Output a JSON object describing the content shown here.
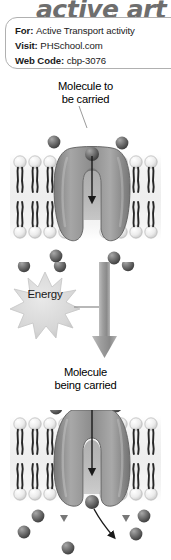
{
  "logo": {
    "text": "active art",
    "color": "#6e6e6e"
  },
  "info_card": {
    "rows": [
      {
        "label": "For:",
        "value": "Active Transport activity"
      },
      {
        "label": "Visit:",
        "value": "PHSchool.com"
      },
      {
        "label": "Web Code:",
        "value": "cbp-3076"
      }
    ]
  },
  "captions": {
    "top_line1": "Molecule to",
    "top_line2": "be carried",
    "bottom_line1": "Molecule",
    "bottom_line2": "being carried"
  },
  "energy": {
    "label": "Energy"
  },
  "colors": {
    "membrane_bg": "#f2f2f2",
    "lipid_head": "#ededed",
    "lipid_tail": "#2b2b2b",
    "protein_fill": "#8e8e8e",
    "protein_dark": "#6f6f6f",
    "molecule": "#5a5a5a",
    "arrow_gray": "#9a9a9a",
    "starburst": "#d9d9d9",
    "text": "#1a1a1a"
  },
  "diagram": {
    "type": "biology-illustration",
    "panels": [
      {
        "name": "before-transport",
        "description": "Molecule binds to carrier protein at outer membrane surface; arrow points inward through the protein channel."
      },
      {
        "name": "after-transport",
        "description": "Carrier protein has changed shape; molecule is released into the cell interior; curved arrow shows release direction."
      }
    ]
  }
}
